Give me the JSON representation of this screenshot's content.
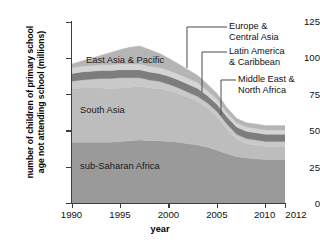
{
  "chart_data": {
    "type": "area",
    "title": "",
    "xlabel": "year",
    "ylabel_line1": "number of children of primary school",
    "ylabel_line2": "age not attending school (millions)",
    "stacked": true,
    "grid": false,
    "legend_position": "inline-annotations",
    "x": [
      1990,
      1991,
      1992,
      1993,
      1994,
      1995,
      1996,
      1997,
      1998,
      1999,
      2000,
      2001,
      2002,
      2003,
      2004,
      2005,
      2006,
      2007,
      2008,
      2009,
      2010,
      2011,
      2012
    ],
    "xlim": [
      1990,
      2012
    ],
    "ylim": [
      0,
      125
    ],
    "xticks": [
      1990,
      1995,
      2000,
      2005,
      2010,
      2012
    ],
    "xtick_labels": [
      "1990",
      "1995",
      "2000",
      "2005",
      "2010",
      "2012"
    ],
    "yticks": [
      0,
      25,
      50,
      75,
      100,
      125
    ],
    "ytick_labels": [
      "0",
      "25",
      "50",
      "75",
      "100",
      "125"
    ],
    "series": [
      {
        "name": "sub-Saharan Africa",
        "color": "#9a9a9a",
        "values": [
          42,
          42,
          42,
          42,
          42,
          42.5,
          43,
          43.5,
          43,
          43,
          42.5,
          42,
          41,
          40,
          38.5,
          36.5,
          34,
          32,
          31,
          30.5,
          30,
          30,
          30
        ]
      },
      {
        "name": "South Asia",
        "color": "#bdbdbd",
        "values": [
          37,
          37.5,
          37.5,
          37.5,
          37,
          37,
          37,
          37,
          36.5,
          36,
          35,
          33.5,
          32,
          30,
          27,
          23,
          17,
          12,
          10,
          9.5,
          9,
          9,
          9
        ]
      },
      {
        "name": "East Asia & Pacific",
        "color": "#c9c9c9",
        "values": [
          5,
          5.5,
          6,
          6.5,
          7,
          7,
          6.5,
          6,
          5.5,
          5,
          4.5,
          4,
          3.5,
          3.5,
          3.5,
          3.5,
          3.5,
          3.5,
          3.5,
          3.5,
          3.5,
          3.5,
          3.5
        ]
      },
      {
        "name": "Middle East & North Africa",
        "color": "#7d7d7d",
        "values": [
          5.5,
          5.5,
          5.5,
          5.5,
          5.5,
          5.5,
          5.5,
          5.5,
          5.5,
          5.5,
          5.5,
          5.5,
          5.5,
          5.5,
          5,
          5,
          5,
          5,
          5,
          5,
          5,
          5,
          5
        ]
      },
      {
        "name": "Latin America & Caribbean",
        "color": "#d4d4d4",
        "values": [
          4,
          4,
          4,
          4,
          4,
          4,
          4,
          4,
          4,
          4,
          4,
          4,
          4,
          4,
          3.5,
          3.5,
          3,
          3,
          3,
          3,
          3,
          3,
          3
        ]
      },
      {
        "name": "Europe & Central Asia",
        "color": "#b5b5b5",
        "values": [
          2.5,
          3.5,
          5,
          6.5,
          8.5,
          10,
          11.5,
          12.5,
          11.5,
          10,
          8.5,
          7,
          6,
          5,
          4.5,
          4,
          3.5,
          3,
          3,
          3,
          3,
          3,
          3
        ]
      }
    ],
    "inline_labels": [
      {
        "text": "East Asia & Pacific",
        "series": "East Asia & Pacific"
      },
      {
        "text": "South Asia",
        "series": "South Asia"
      },
      {
        "text": "sub-Saharan Africa",
        "series": "sub-Saharan Africa"
      }
    ],
    "callouts": [
      {
        "line1": "Europe &",
        "line2": "Central Asia",
        "series": "Europe & Central Asia"
      },
      {
        "line1": "Latin America",
        "line2": "& Caribbean",
        "series": "Latin America & Caribbean"
      },
      {
        "line1": "Middle East &",
        "line2": "North Africa",
        "series": "Middle East & North Africa"
      }
    ],
    "axis_color": "#3d3d3d"
  }
}
